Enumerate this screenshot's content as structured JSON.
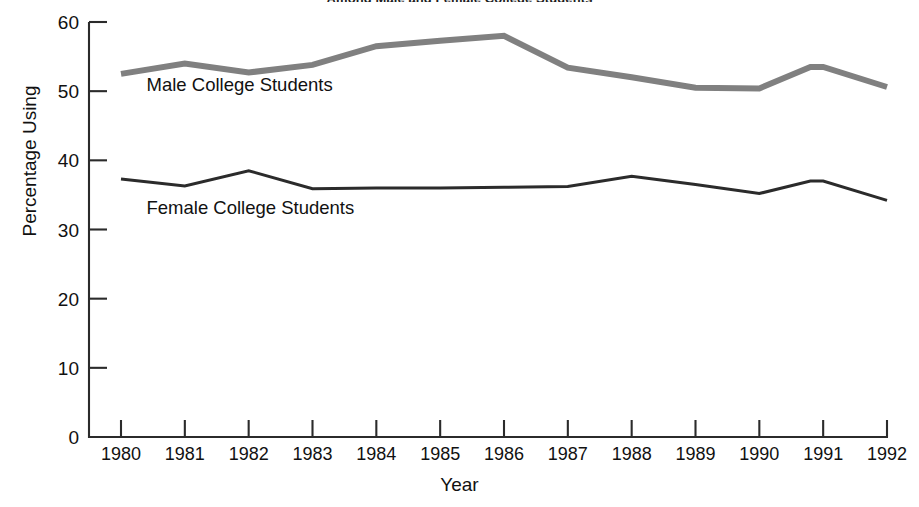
{
  "chart_data": {
    "type": "line",
    "title": "Among Male and Female College Students",
    "xlabel": "Year",
    "ylabel": "Percentage Using",
    "categories": [
      "1980",
      "1981",
      "1982",
      "1983",
      "1984",
      "1985",
      "1986",
      "1987",
      "1988",
      "1989",
      "1990",
      "1991",
      "1992"
    ],
    "x": [
      1980,
      1981,
      1982,
      1983,
      1984,
      1985,
      1986,
      1987,
      1988,
      1989,
      1990,
      1991,
      1992
    ],
    "xlim": [
      1980,
      1992
    ],
    "ylim": [
      0,
      60
    ],
    "ytick_labels": [
      "60",
      "50",
      "40",
      "30",
      "20",
      "10",
      "0"
    ],
    "ytick_values": [
      60,
      50,
      40,
      30,
      20,
      10,
      0
    ],
    "grid": false,
    "legend": "inline-labels",
    "series": [
      {
        "name": "Male College Students",
        "color": "#808080",
        "line_width": 6,
        "values": [
          52.5,
          54.0,
          52.7,
          53.8,
          56.5,
          57.3,
          58.0,
          53.4,
          52.0,
          50.5,
          50.4,
          53.5,
          50.6
        ],
        "extra_vertices": [
          {
            "x": 1990.8,
            "y": 53.5
          }
        ]
      },
      {
        "name": "Female College Students",
        "color": "#2b2b2b",
        "line_width": 3,
        "values": [
          37.3,
          36.3,
          38.5,
          35.9,
          36.0,
          36.0,
          36.1,
          36.2,
          37.7,
          36.5,
          35.2,
          37.0,
          34.2
        ],
        "extra_vertices": [
          {
            "x": 1990.8,
            "y": 37.0
          }
        ]
      }
    ],
    "annotations": [
      {
        "text": "Male College Students",
        "x": 1980.4,
        "y": 50.0
      },
      {
        "text": "Female College Students",
        "x": 1980.4,
        "y": 32.3
      }
    ]
  }
}
